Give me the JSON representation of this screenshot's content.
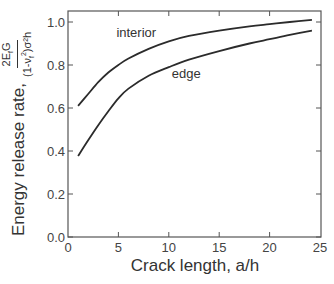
{
  "chart_data": {
    "type": "line",
    "title": "",
    "xlabel": "Crack length, a/h",
    "ylabel": "Energy release rate, 2E_fG / ((1-ν_f²)σ²h)",
    "xlim": [
      0,
      25
    ],
    "ylim": [
      0.0,
      1.05
    ],
    "xticks": [
      0,
      5,
      10,
      15,
      20,
      25
    ],
    "yticks": [
      0.0,
      0.2,
      0.4,
      0.6,
      0.8,
      1.0
    ],
    "xtick_labels": [
      "0",
      "5",
      "10",
      "15",
      "20",
      "25"
    ],
    "ytick_labels": [
      "0.0",
      "0.2",
      "0.4",
      "0.6",
      "0.8",
      "1.0"
    ],
    "grid": false,
    "legend": "none (curves labeled inline)",
    "series": [
      {
        "name": "interior",
        "x": [
          1,
          2,
          3,
          4,
          5,
          6,
          8,
          10,
          12,
          15,
          18,
          20,
          22,
          24.2
        ],
        "y": [
          0.61,
          0.665,
          0.72,
          0.765,
          0.8,
          0.83,
          0.875,
          0.91,
          0.935,
          0.96,
          0.98,
          0.99,
          1.0,
          1.01
        ]
      },
      {
        "name": "edge",
        "x": [
          1,
          2,
          3,
          4,
          5,
          6,
          8,
          10,
          12,
          15,
          18,
          20,
          22,
          24.2
        ],
        "y": [
          0.377,
          0.45,
          0.52,
          0.585,
          0.645,
          0.69,
          0.75,
          0.79,
          0.825,
          0.865,
          0.9,
          0.92,
          0.94,
          0.96
        ]
      }
    ],
    "annotations": [
      {
        "text": "interior",
        "x": 4.8,
        "y": 0.93
      },
      {
        "text": "edge",
        "x": 10.3,
        "y": 0.74
      }
    ]
  },
  "labels": {
    "y_main": "Energy release rate,",
    "y_frac_num": "2E",
    "y_frac_num_sub": "f",
    "y_frac_num_tail": "G",
    "y_frac_den": "(1-ν",
    "y_frac_den_sub": "f",
    "y_frac_den_sup": "2",
    "y_frac_den_tail": ")σ²h",
    "x_main": "Crack length, a/h"
  },
  "colors": {
    "curve": "#2b2b2b",
    "axis": "#555555",
    "text": "#333333"
  }
}
